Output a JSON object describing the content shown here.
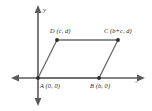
{
  "figure": {
    "kind": "coordinate-plane-parallelogram",
    "axes": {
      "x_label": "x",
      "y_label": "y",
      "origin_px": [
        38,
        78
      ]
    },
    "vertices": [
      {
        "id": "A",
        "label": "A (0, 0)",
        "x_expr": "0",
        "y_expr": "0",
        "px": [
          38,
          78
        ]
      },
      {
        "id": "B",
        "label": "B (b, 0)",
        "x_expr": "b",
        "y_expr": "0",
        "px": [
          99,
          78
        ]
      },
      {
        "id": "C",
        "label": "C (b+c, d)",
        "x_expr": "b+c",
        "y_expr": "d",
        "px": [
          118,
          40
        ]
      },
      {
        "id": "D",
        "label": "D (c, d)",
        "x_expr": "c",
        "y_expr": "d",
        "px": [
          57,
          40
        ]
      }
    ],
    "edges": [
      {
        "from": "A",
        "to": "B"
      },
      {
        "from": "B",
        "to": "C"
      },
      {
        "from": "C",
        "to": "D"
      },
      {
        "from": "D",
        "to": "A"
      }
    ],
    "colors": {
      "axis": "#5a5a5a",
      "shape_stroke": "#6b6b6b",
      "vertex_dot": "#2b2b2b",
      "label_text": "#2b2b2b",
      "background": "#ffffff"
    }
  }
}
